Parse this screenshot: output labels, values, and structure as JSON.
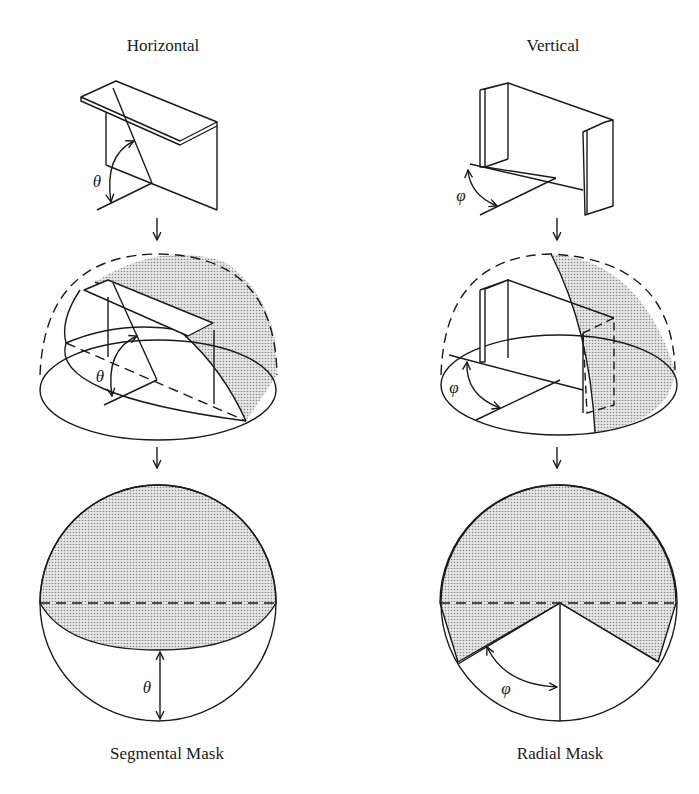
{
  "columns": [
    {
      "id": "horizontal",
      "title": "Horizontal",
      "caption": "Segmental Mask",
      "angle_symbol": "θ"
    },
    {
      "id": "vertical",
      "title": "Vertical",
      "caption": "Radial Mask",
      "angle_symbol": "φ"
    }
  ],
  "arrows": [
    "↓",
    "↓"
  ],
  "colors": {
    "line": "#1a1a1a",
    "shade": "#c8c8c8",
    "background": "#ffffff"
  }
}
